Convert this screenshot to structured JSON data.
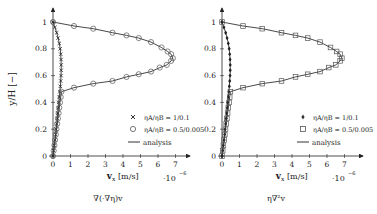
{
  "chart_data": [
    {
      "type": "line",
      "title": "",
      "caption": "∇(·∇η)v",
      "xlabel": "v_x [m/s]",
      "x_scale_note": "·10^-6",
      "ylabel": "y/H [−]",
      "xlim": [
        0,
        7.8
      ],
      "ylim": [
        0,
        1.08
      ],
      "xticks": [
        0,
        1,
        2,
        3,
        4,
        5,
        6,
        7
      ],
      "yticks": [
        0,
        0.2,
        0.4,
        0.6,
        0.8,
        1
      ],
      "legend_position": "lower right",
      "series": [
        {
          "name": "ηA/ηB = 1/0.1",
          "marker": "x",
          "points": [
            [
              0,
              0
            ],
            [
              0.04,
              0.04
            ],
            [
              0.08,
              0.08
            ],
            [
              0.12,
              0.12
            ],
            [
              0.15,
              0.16
            ],
            [
              0.18,
              0.2
            ],
            [
              0.21,
              0.24
            ],
            [
              0.24,
              0.28
            ],
            [
              0.27,
              0.32
            ],
            [
              0.3,
              0.36
            ],
            [
              0.33,
              0.4
            ],
            [
              0.36,
              0.44
            ],
            [
              0.39,
              0.48
            ],
            [
              0.42,
              0.52
            ],
            [
              0.44,
              0.56
            ],
            [
              0.46,
              0.6
            ],
            [
              0.47,
              0.64
            ],
            [
              0.47,
              0.68
            ],
            [
              0.46,
              0.72
            ],
            [
              0.44,
              0.76
            ],
            [
              0.41,
              0.8
            ],
            [
              0.36,
              0.84
            ],
            [
              0.29,
              0.88
            ],
            [
              0.21,
              0.92
            ],
            [
              0.11,
              0.96
            ],
            [
              0,
              1
            ]
          ]
        },
        {
          "name": "ηA/ηB = 0.5/0.005",
          "marker": "o",
          "points": [
            [
              0,
              0
            ],
            [
              0.04,
              0.04
            ],
            [
              0.08,
              0.08
            ],
            [
              0.12,
              0.12
            ],
            [
              0.16,
              0.16
            ],
            [
              0.2,
              0.2
            ],
            [
              0.24,
              0.24
            ],
            [
              0.28,
              0.28
            ],
            [
              0.32,
              0.32
            ],
            [
              0.36,
              0.36
            ],
            [
              0.4,
              0.4
            ],
            [
              0.44,
              0.44
            ],
            [
              0.48,
              0.48
            ],
            [
              1.2,
              0.51
            ],
            [
              2.3,
              0.54
            ],
            [
              3.4,
              0.56
            ],
            [
              4.2,
              0.59
            ],
            [
              4.9,
              0.61
            ],
            [
              5.6,
              0.63
            ],
            [
              6.1,
              0.66
            ],
            [
              6.5,
              0.68
            ],
            [
              6.75,
              0.71
            ],
            [
              6.85,
              0.73
            ],
            [
              6.75,
              0.76
            ],
            [
              6.55,
              0.78
            ],
            [
              6.2,
              0.81
            ],
            [
              5.6,
              0.85
            ],
            [
              4.9,
              0.88
            ],
            [
              4.2,
              0.9
            ],
            [
              3.4,
              0.92
            ],
            [
              2.3,
              0.95
            ],
            [
              1.2,
              0.97
            ],
            [
              0,
              1
            ]
          ]
        },
        {
          "name": "analysis",
          "marker": "line"
        }
      ]
    },
    {
      "type": "line",
      "title": "",
      "caption": "η∇²v",
      "xlabel": "v_x [m/s]",
      "x_scale_note": "·10^-6",
      "ylabel": "",
      "xlim": [
        0,
        7.8
      ],
      "ylim": [
        0,
        1.08
      ],
      "xticks": [
        0,
        1,
        2,
        3,
        4,
        5,
        6,
        7
      ],
      "yticks": [
        0,
        0.2,
        0.4,
        0.6,
        0.8,
        1
      ],
      "legend_position": "lower right",
      "series": [
        {
          "name": "ηA/ηB = 1/0.1",
          "marker": "diamond",
          "points": [
            [
              0,
              0
            ],
            [
              0.04,
              0.04
            ],
            [
              0.08,
              0.08
            ],
            [
              0.12,
              0.12
            ],
            [
              0.15,
              0.16
            ],
            [
              0.18,
              0.2
            ],
            [
              0.21,
              0.24
            ],
            [
              0.24,
              0.28
            ],
            [
              0.27,
              0.32
            ],
            [
              0.3,
              0.36
            ],
            [
              0.33,
              0.4
            ],
            [
              0.36,
              0.44
            ],
            [
              0.39,
              0.48
            ],
            [
              0.42,
              0.52
            ],
            [
              0.44,
              0.56
            ],
            [
              0.46,
              0.6
            ],
            [
              0.47,
              0.64
            ],
            [
              0.47,
              0.68
            ],
            [
              0.46,
              0.72
            ],
            [
              0.44,
              0.76
            ],
            [
              0.41,
              0.8
            ],
            [
              0.36,
              0.84
            ],
            [
              0.29,
              0.88
            ],
            [
              0.21,
              0.92
            ],
            [
              0.11,
              0.96
            ],
            [
              0,
              1
            ]
          ]
        },
        {
          "name": "ηA/ηB = 0.5/0.005",
          "marker": "square",
          "points": [
            [
              0,
              0
            ],
            [
              0.04,
              0.04
            ],
            [
              0.08,
              0.08
            ],
            [
              0.12,
              0.12
            ],
            [
              0.16,
              0.16
            ],
            [
              0.2,
              0.2
            ],
            [
              0.24,
              0.24
            ],
            [
              0.28,
              0.28
            ],
            [
              0.32,
              0.32
            ],
            [
              0.36,
              0.36
            ],
            [
              0.4,
              0.4
            ],
            [
              0.44,
              0.44
            ],
            [
              0.48,
              0.48
            ],
            [
              1.2,
              0.51
            ],
            [
              2.3,
              0.54
            ],
            [
              3.4,
              0.56
            ],
            [
              4.2,
              0.59
            ],
            [
              4.9,
              0.61
            ],
            [
              5.6,
              0.63
            ],
            [
              6.1,
              0.66
            ],
            [
              6.5,
              0.68
            ],
            [
              6.75,
              0.71
            ],
            [
              6.85,
              0.73
            ],
            [
              6.75,
              0.76
            ],
            [
              6.55,
              0.78
            ],
            [
              6.2,
              0.81
            ],
            [
              5.6,
              0.85
            ],
            [
              4.9,
              0.88
            ],
            [
              4.2,
              0.9
            ],
            [
              3.4,
              0.92
            ],
            [
              2.3,
              0.95
            ],
            [
              1.2,
              0.97
            ],
            [
              0,
              1
            ]
          ]
        },
        {
          "name": "analysis",
          "marker": "line"
        }
      ]
    }
  ],
  "labels": {
    "left": {
      "ylabel": "y/H [−]",
      "xlabel_main": "v",
      "xlabel_sub": "x",
      "xlabel_unit": "[m/s]",
      "scale": "·10",
      "scale_exp": "−6",
      "caption": "∇(·∇η)v",
      "legend": [
        "ηA/ηB = 1/0.1",
        "ηA/ηB = 0.5/0.005",
        "analysis"
      ]
    },
    "right": {
      "xlabel_main": "v",
      "xlabel_sub": "x",
      "xlabel_unit": "[m/s]",
      "scale": "·10",
      "scale_exp": "−6",
      "caption": "η∇²v",
      "legend": [
        "ηA/ηB = 1/0.1",
        "ηA/ηB = 0.5/0.005",
        "analysis"
      ]
    },
    "xtick_labels": [
      "0",
      "1",
      "2",
      "3",
      "4",
      "5",
      "6",
      "7"
    ],
    "ytick_labels": [
      "0",
      "0.2",
      "0.4",
      "0.6",
      "0.8",
      "1"
    ]
  },
  "colors": {
    "line": "#333333",
    "marker": "#555555",
    "text": "#222222"
  }
}
